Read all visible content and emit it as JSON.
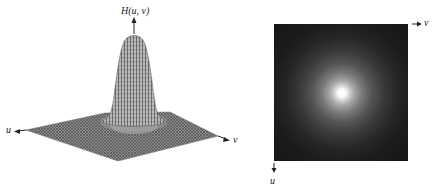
{
  "figure": {
    "left_plot": {
      "type": "3d-surface-mesh",
      "function_label": "H(u, v)",
      "axis_u_label": "u",
      "axis_v_label": "v",
      "description": "Gaussian lowpass filter transfer function shown as a 3-D wireframe perspective plot",
      "mesh_color": "#555555"
    },
    "right_plot": {
      "type": "image",
      "axis_v_label": "v",
      "axis_u_label": "u",
      "description": "Filter displayed as an image: bright center fading to dark",
      "background_color": "#161616",
      "center_color": "#ffffff"
    }
  }
}
